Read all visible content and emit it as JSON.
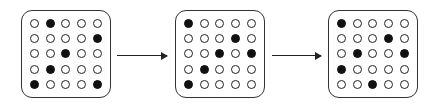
{
  "diagram": {
    "grids": [
      {
        "id": "grid-1",
        "left": 21,
        "rows": [
          [
            0,
            1,
            0,
            0,
            0
          ],
          [
            0,
            0,
            0,
            0,
            1
          ],
          [
            0,
            0,
            1,
            0,
            0
          ],
          [
            0,
            1,
            0,
            0,
            0
          ],
          [
            1,
            0,
            0,
            0,
            1
          ]
        ]
      },
      {
        "id": "grid-2",
        "left": 175,
        "rows": [
          [
            1,
            0,
            0,
            0,
            0
          ],
          [
            0,
            0,
            0,
            1,
            0
          ],
          [
            0,
            0,
            1,
            0,
            1
          ],
          [
            0,
            1,
            0,
            0,
            0
          ],
          [
            1,
            0,
            0,
            0,
            0
          ]
        ]
      },
      {
        "id": "grid-3",
        "left": 328,
        "rows": [
          [
            1,
            0,
            0,
            0,
            0
          ],
          [
            0,
            0,
            0,
            1,
            0
          ],
          [
            0,
            1,
            0,
            0,
            1
          ],
          [
            1,
            0,
            0,
            0,
            0
          ],
          [
            0,
            0,
            1,
            0,
            0
          ]
        ]
      }
    ],
    "arrows": [
      {
        "from": "grid-1",
        "to": "grid-2",
        "left": 117,
        "width": 50
      },
      {
        "from": "grid-2",
        "to": "grid-3",
        "left": 272,
        "width": 49
      }
    ],
    "colors": {
      "filled": "#111111",
      "empty": "#ffffff",
      "stroke": "#222222"
    }
  }
}
